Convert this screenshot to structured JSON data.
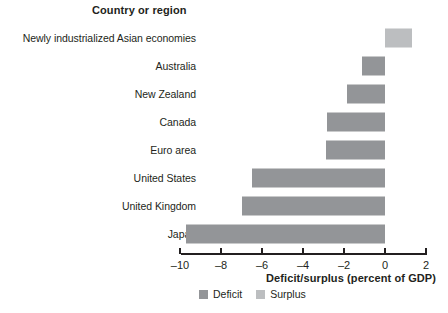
{
  "header": {
    "column_title": "Country or region"
  },
  "chart_data": {
    "type": "bar",
    "orientation": "horizontal",
    "title": "",
    "xlabel": "Deficit/surplus (percent of GDP)",
    "ylabel": "Country or region",
    "xlim": [
      -10.6,
      2.4
    ],
    "xticks": [
      -10,
      -8,
      -6,
      -4,
      -2,
      0,
      2
    ],
    "xtick_labels": [
      "–10",
      "–8",
      "–6",
      "–4",
      "–2",
      "0",
      "2"
    ],
    "grid": false,
    "legend_position": "bottom",
    "categories": [
      "Newly industrialized Asian economies",
      "Australia",
      "New Zealand",
      "Canada",
      "Euro area",
      "United States",
      "United Kingdom",
      "Japan"
    ],
    "values": [
      1.3,
      -1.1,
      -1.85,
      -2.85,
      -2.9,
      -6.5,
      -7.0,
      -9.7
    ],
    "series": [
      {
        "name": "Deficit/surplus",
        "values": [
          1.3,
          -1.1,
          -1.85,
          -2.85,
          -2.9,
          -6.5,
          -7.0,
          -9.7
        ]
      }
    ],
    "legend": [
      {
        "label": "Deficit",
        "color": "#939598"
      },
      {
        "label": "Surplus",
        "color": "#bcbec0"
      }
    ],
    "colors": {
      "deficit": "#939598",
      "surplus": "#bcbec0",
      "axis": "#231f20",
      "text": "#231f20",
      "background": "#ffffff"
    }
  }
}
